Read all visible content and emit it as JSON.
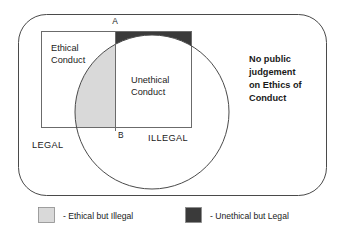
{
  "diagram": {
    "type": "venn",
    "regions": {
      "ethical_conduct": {
        "label_line1": "Ethical",
        "label_line2": "Conduct"
      },
      "unethical_conduct": {
        "label_line1": "Unethical",
        "label_line2": "Conduct"
      },
      "legal": {
        "label": "LEGAL"
      },
      "illegal": {
        "label": "ILLEGAL"
      },
      "no_public_judgement": {
        "label_line1": "No public",
        "label_line2": "judgement",
        "label_line3": "on Ethics of",
        "label_line4": "Conduct"
      }
    },
    "markers": [
      {
        "label": "A"
      },
      {
        "label": "B"
      }
    ],
    "legend": [
      {
        "swatch_color": "#d9d9d9",
        "label": "- Ethical but Illegal"
      },
      {
        "swatch_color": "#3a3a3a",
        "label": "- Unethical but Legal"
      }
    ],
    "colors": {
      "ethical_but_illegal_fill": "#d9d9d9",
      "unethical_but_legal_fill": "#3a3a3a",
      "outline": "#4a4a4a",
      "rect_outline": "#6b6b6b",
      "background": "#ffffff",
      "text": "#1a1a1a"
    }
  }
}
